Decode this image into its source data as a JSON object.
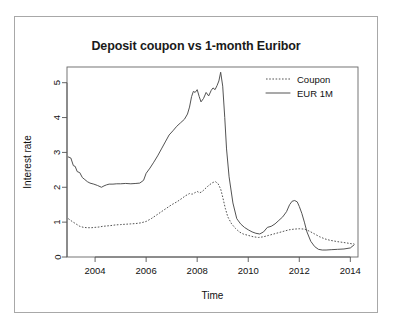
{
  "figure": {
    "outer_border": true,
    "background": "#ffffff",
    "line_color": "#4a4a4a"
  },
  "chart_data": {
    "type": "line",
    "title": "Deposit coupon vs 1-month Euribor",
    "xlabel": "Time",
    "ylabel": "Interest rate",
    "xlim": [
      2002.9,
      2014.3
    ],
    "ylim": [
      0,
      5.45
    ],
    "xticks": [
      2004,
      2006,
      2008,
      2010,
      2012,
      2014
    ],
    "xtick_labels": [
      "2004",
      "2006",
      "2008",
      "2010",
      "2012",
      "2014"
    ],
    "yticks": [
      0,
      1,
      2,
      3,
      4,
      5
    ],
    "ytick_labels": [
      "0",
      "1",
      "2",
      "3",
      "4",
      "5"
    ],
    "grid": false,
    "legend_position": "top-right",
    "legend": [
      "Coupon",
      "EUR 1M"
    ],
    "series": [
      {
        "name": "EUR 1M",
        "style": "solid",
        "x": [
          2002.95,
          2003.05,
          2003.15,
          2003.22,
          2003.3,
          2003.4,
          2003.5,
          2003.6,
          2003.7,
          2003.8,
          2003.95,
          2004.1,
          2004.25,
          2004.35,
          2004.45,
          2004.55,
          2004.7,
          2004.85,
          2005.0,
          2005.2,
          2005.4,
          2005.6,
          2005.75,
          2005.9,
          2006.0,
          2006.15,
          2006.3,
          2006.45,
          2006.6,
          2006.75,
          2006.9,
          2007.05,
          2007.2,
          2007.35,
          2007.5,
          2007.62,
          2007.7,
          2007.78,
          2007.85,
          2007.92,
          2008.0,
          2008.08,
          2008.15,
          2008.25,
          2008.35,
          2008.45,
          2008.55,
          2008.62,
          2008.7,
          2008.78,
          2008.85,
          2008.92,
          2009.0,
          2009.08,
          2009.15,
          2009.25,
          2009.4,
          2009.55,
          2009.7,
          2009.85,
          2010.0,
          2010.15,
          2010.3,
          2010.45,
          2010.6,
          2010.75,
          2010.9,
          2011.05,
          2011.2,
          2011.35,
          2011.5,
          2011.62,
          2011.72,
          2011.82,
          2011.92,
          2012.0,
          2012.1,
          2012.2,
          2012.3,
          2012.45,
          2012.6,
          2012.75,
          2012.9,
          2013.05,
          2013.25,
          2013.5,
          2013.75,
          2014.0,
          2014.15
        ],
        "values": [
          2.87,
          2.84,
          2.62,
          2.6,
          2.45,
          2.42,
          2.28,
          2.22,
          2.16,
          2.12,
          2.09,
          2.05,
          2.0,
          2.04,
          2.07,
          2.09,
          2.09,
          2.1,
          2.1,
          2.11,
          2.1,
          2.11,
          2.12,
          2.2,
          2.4,
          2.55,
          2.72,
          2.9,
          3.1,
          3.3,
          3.5,
          3.62,
          3.75,
          3.85,
          3.95,
          4.1,
          4.3,
          4.6,
          4.75,
          4.72,
          4.8,
          4.6,
          4.45,
          4.55,
          4.72,
          4.62,
          4.78,
          4.85,
          4.8,
          4.92,
          5.05,
          5.3,
          4.9,
          4.0,
          3.1,
          2.3,
          1.55,
          1.1,
          0.95,
          0.85,
          0.78,
          0.72,
          0.68,
          0.66,
          0.72,
          0.85,
          0.88,
          0.95,
          1.05,
          1.15,
          1.3,
          1.5,
          1.6,
          1.62,
          1.58,
          1.45,
          1.25,
          1.0,
          0.72,
          0.45,
          0.3,
          0.22,
          0.2,
          0.2,
          0.21,
          0.22,
          0.23,
          0.26,
          0.35
        ]
      },
      {
        "name": "Coupon",
        "style": "dashed",
        "x": [
          2002.95,
          2003.1,
          2003.25,
          2003.4,
          2003.55,
          2003.7,
          2003.85,
          2004.0,
          2004.15,
          2004.3,
          2004.45,
          2004.6,
          2004.8,
          2005.0,
          2005.2,
          2005.4,
          2005.6,
          2005.8,
          2006.0,
          2006.2,
          2006.4,
          2006.6,
          2006.8,
          2007.0,
          2007.2,
          2007.4,
          2007.55,
          2007.7,
          2007.8,
          2007.9,
          2008.0,
          2008.1,
          2008.2,
          2008.3,
          2008.4,
          2008.5,
          2008.62,
          2008.72,
          2008.82,
          2008.92,
          2009.0,
          2009.1,
          2009.2,
          2009.35,
          2009.5,
          2009.65,
          2009.8,
          2010.0,
          2010.2,
          2010.4,
          2010.6,
          2010.8,
          2011.0,
          2011.2,
          2011.4,
          2011.6,
          2011.8,
          2012.0,
          2012.2,
          2012.4,
          2012.6,
          2012.8,
          2013.0,
          2013.2,
          2013.5,
          2013.8,
          2014.05,
          2014.15
        ],
        "values": [
          1.1,
          1.02,
          0.95,
          0.88,
          0.85,
          0.84,
          0.84,
          0.85,
          0.86,
          0.88,
          0.89,
          0.9,
          0.92,
          0.93,
          0.94,
          0.95,
          0.96,
          0.98,
          1.02,
          1.1,
          1.2,
          1.3,
          1.4,
          1.5,
          1.58,
          1.68,
          1.76,
          1.82,
          1.8,
          1.84,
          1.88,
          1.84,
          1.88,
          1.95,
          2.02,
          2.08,
          2.14,
          2.16,
          2.1,
          1.95,
          1.72,
          1.4,
          1.15,
          0.95,
          0.82,
          0.72,
          0.66,
          0.62,
          0.58,
          0.56,
          0.58,
          0.62,
          0.66,
          0.7,
          0.74,
          0.78,
          0.8,
          0.81,
          0.8,
          0.74,
          0.66,
          0.58,
          0.52,
          0.48,
          0.44,
          0.41,
          0.38,
          0.38
        ]
      }
    ]
  }
}
